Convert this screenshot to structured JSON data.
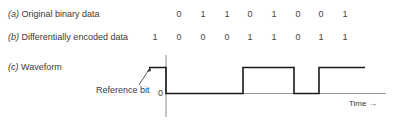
{
  "rows": {
    "a": {
      "tag": "(a)",
      "label": "Original binary data",
      "bits": [
        "0",
        "1",
        "1",
        "0",
        "1",
        "0",
        "0",
        "1"
      ]
    },
    "b": {
      "tag": "(b)",
      "label": "Differentially encoded data",
      "bits": [
        "1",
        "0",
        "0",
        "0",
        "1",
        "1",
        "0",
        "1",
        "1"
      ]
    },
    "c": {
      "tag": "(c)",
      "label": "Waveform"
    }
  },
  "waveform": {
    "reference_label": "Reference bit",
    "zero_label": "0",
    "time_label": "Time →",
    "levels": [
      1,
      0,
      0,
      0,
      1,
      1,
      0,
      1,
      1
    ]
  },
  "colors": {
    "line": "#1a1a1a",
    "axis": "#888888",
    "text": "#3a3a3a"
  }
}
